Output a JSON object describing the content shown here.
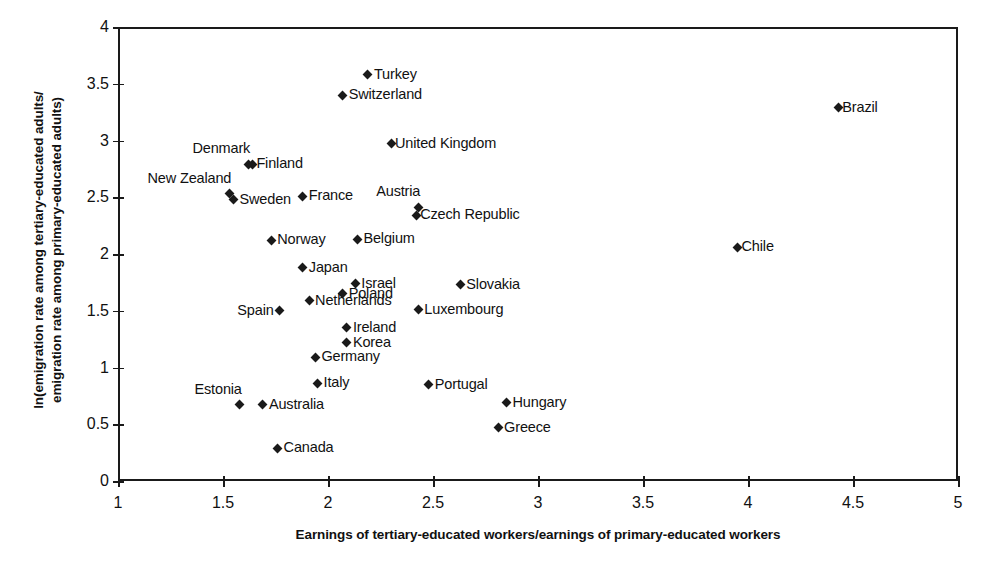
{
  "chart_data": {
    "type": "scatter",
    "title": "",
    "xlabel": "Earnings of tertiary-educated workers/earnings of primary-educated workers",
    "ylabel_line1": "ln(emigration rate among tertiary-educated adults/",
    "ylabel_line2": "emigration rate among primary-educated adults)",
    "xlim": [
      1,
      5
    ],
    "ylim": [
      0,
      4
    ],
    "xticks": [
      "1",
      "1.5",
      "2",
      "2.5",
      "3",
      "3.5",
      "4",
      "4.5",
      "5"
    ],
    "xtick_values": [
      1,
      1.5,
      2,
      2.5,
      3,
      3.5,
      4,
      4.5,
      5
    ],
    "yticks": [
      "0",
      "0.5",
      "1",
      "1.5",
      "2",
      "2.5",
      "3",
      "3.5",
      "4"
    ],
    "ytick_values": [
      0,
      0.5,
      1,
      1.5,
      2,
      2.5,
      3,
      3.5,
      4
    ],
    "grid": false,
    "legend": null,
    "marker_color": "#1a1a1a",
    "marker_shape": "diamond",
    "points": [
      {
        "label": "Turkey",
        "x": 2.19,
        "y": 3.58,
        "labelpos": "pos-right"
      },
      {
        "label": "Switzerland",
        "x": 2.07,
        "y": 3.4,
        "labelpos": "pos-right"
      },
      {
        "label": "Brazil",
        "x": 4.43,
        "y": 3.29,
        "labelpos": "pos-right-tight"
      },
      {
        "label": "United Kingdom",
        "x": 2.3,
        "y": 2.97,
        "labelpos": "pos-right-tight"
      },
      {
        "label": "Denmark",
        "x": 1.62,
        "y": 2.79,
        "labelpos": "pos-above-left"
      },
      {
        "label": "Finland",
        "x": 1.64,
        "y": 2.79,
        "labelpos": "pos-right-tight"
      },
      {
        "label": "New Zealand",
        "x": 1.53,
        "y": 2.53,
        "labelpos": "pos-above-left"
      },
      {
        "label": "Sweden",
        "x": 1.55,
        "y": 2.48,
        "labelpos": "pos-right"
      },
      {
        "label": "France",
        "x": 1.88,
        "y": 2.51,
        "labelpos": "pos-right"
      },
      {
        "label": "Austria",
        "x": 2.43,
        "y": 2.41,
        "labelpos": "pos-above-left"
      },
      {
        "label": "Czech Republic",
        "x": 2.42,
        "y": 2.34,
        "labelpos": "pos-right-tight"
      },
      {
        "label": "Belgium",
        "x": 2.14,
        "y": 2.13,
        "labelpos": "pos-right"
      },
      {
        "label": "Norway",
        "x": 1.73,
        "y": 2.12,
        "labelpos": "pos-right"
      },
      {
        "label": "Chile",
        "x": 3.95,
        "y": 2.06,
        "labelpos": "pos-right-tight"
      },
      {
        "label": "Japan",
        "x": 1.88,
        "y": 1.88,
        "labelpos": "pos-right"
      },
      {
        "label": "Israel",
        "x": 2.13,
        "y": 1.74,
        "labelpos": "pos-right"
      },
      {
        "label": "Slovakia",
        "x": 2.63,
        "y": 1.73,
        "labelpos": "pos-right"
      },
      {
        "label": "Poland",
        "x": 2.07,
        "y": 1.65,
        "labelpos": "pos-right"
      },
      {
        "label": "Netherlands",
        "x": 1.91,
        "y": 1.59,
        "labelpos": "pos-right"
      },
      {
        "label": "Luxembourg",
        "x": 2.43,
        "y": 1.51,
        "labelpos": "pos-right"
      },
      {
        "label": "Spain",
        "x": 1.77,
        "y": 1.5,
        "labelpos": "pos-left"
      },
      {
        "label": "Ireland",
        "x": 2.09,
        "y": 1.35,
        "labelpos": "pos-right"
      },
      {
        "label": "Korea",
        "x": 2.09,
        "y": 1.22,
        "labelpos": "pos-right"
      },
      {
        "label": "Germany",
        "x": 1.94,
        "y": 1.09,
        "labelpos": "pos-right"
      },
      {
        "label": "Italy",
        "x": 1.95,
        "y": 0.86,
        "labelpos": "pos-right"
      },
      {
        "label": "Portugal",
        "x": 2.48,
        "y": 0.85,
        "labelpos": "pos-right"
      },
      {
        "label": "Hungary",
        "x": 2.85,
        "y": 0.69,
        "labelpos": "pos-right"
      },
      {
        "label": "Estonia",
        "x": 1.58,
        "y": 0.67,
        "labelpos": "pos-above-left"
      },
      {
        "label": "Australia",
        "x": 1.69,
        "y": 0.67,
        "labelpos": "pos-right"
      },
      {
        "label": "Greece",
        "x": 2.81,
        "y": 0.47,
        "labelpos": "pos-right"
      },
      {
        "label": "Canada",
        "x": 1.76,
        "y": 0.29,
        "labelpos": "pos-right"
      }
    ]
  }
}
